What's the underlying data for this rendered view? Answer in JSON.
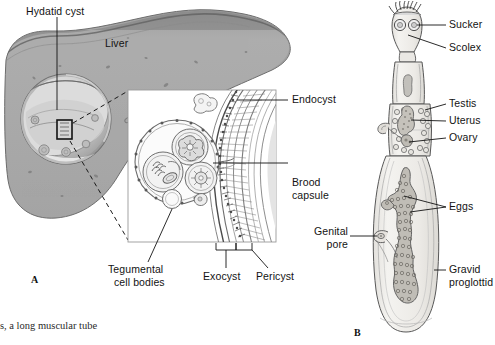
{
  "figure": {
    "panel_a_letter": "A",
    "panel_b_letter": "B",
    "caption_fragment": "s, a long muscular tube"
  },
  "panel_a": {
    "name": "hydatid-cyst-in-liver",
    "labels": {
      "hydatid_cyst": "Hydatid cyst",
      "liver": "Liver",
      "endocyst": "Endocyst",
      "brood_capsule_line1": "Brood",
      "brood_capsule_line2": "capsule",
      "tegumental_line1": "Tegumental",
      "tegumental_line2": "cell bodies",
      "exocyst": "Exocyst",
      "pericyst": "Pericyst"
    }
  },
  "panel_b": {
    "name": "echinococcus-adult-worm",
    "labels": {
      "sucker": "Sucker",
      "scolex": "Scolex",
      "testis": "Testis",
      "uterus": "Uterus",
      "ovary": "Ovary",
      "eggs": "Eggs",
      "genital_pore_line1": "Genital",
      "genital_pore_line2": "pore",
      "gravid_line1": "Gravid",
      "gravid_line2": "proglottid"
    }
  },
  "colors": {
    "liver_fill": "#a9a9a9",
    "liver_shadow": "#8f8f8f",
    "liver_edge": "#6e6e6e",
    "cyst_fill": "#c9c9c9",
    "cyst_highlight": "#e3e3e3",
    "line": "#1a1a1a",
    "worm_fill": "#f0efec",
    "worm_line": "#5a5a5a",
    "egg_fill": "#b9b6b0",
    "background": "#ffffff"
  }
}
